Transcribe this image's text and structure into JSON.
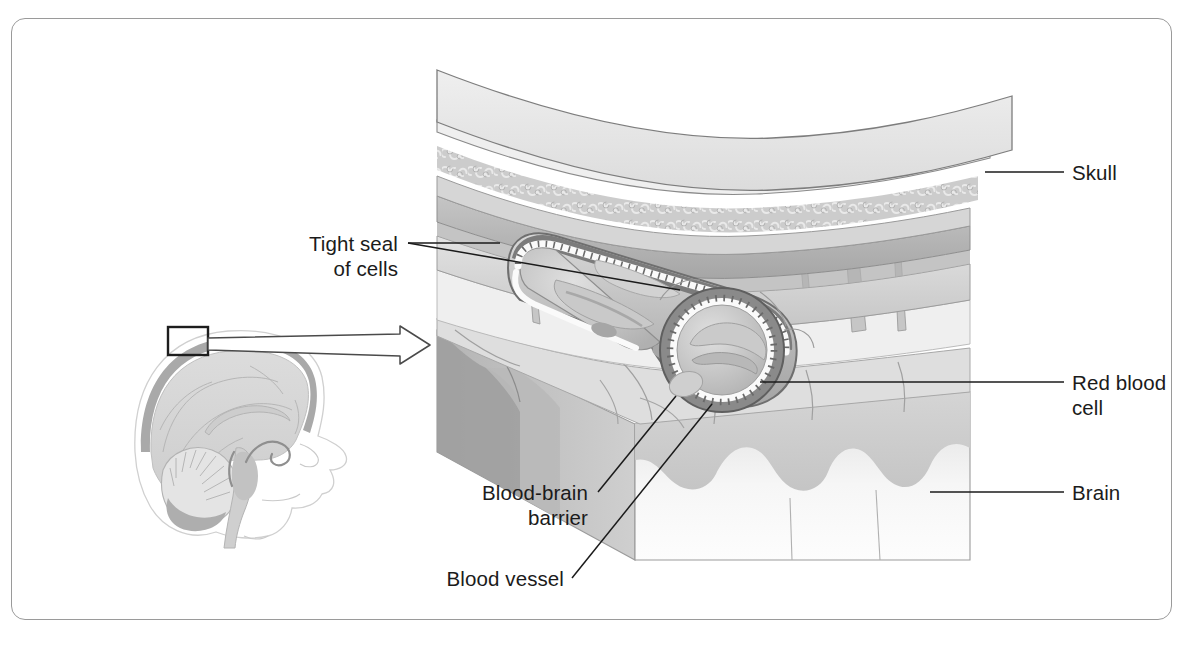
{
  "figure": {
    "frame_color": "#9a9a9a",
    "background": "#ffffff",
    "ink_color": "#1b1b1b"
  },
  "labels": {
    "skull": "Skull",
    "red_blood_cell": "Red blood\ncell",
    "brain": "Brain",
    "tight_seal": "Tight seal\nof cells",
    "blood_brain_barrier": "Blood-brain\nbarrier",
    "blood_vessel": "Blood vessel"
  },
  "inset": {
    "name": "mid-sagittal brain section",
    "callout_box": "magnified region on skull vault"
  },
  "palette": {
    "bone_outer": "#e6e6e6",
    "spongy_bone": "#c9c9c9",
    "dura": "#b8b8b8",
    "arachnoid": "#d2d2d2",
    "brain_top": "#d9d9d9",
    "brain_front": "#f2f2f2",
    "brain_side": "#c4c4c4",
    "vessel_wall": "#8e8e8e",
    "vessel_lining": "#fbfbfb",
    "rbc": "#bdbdbd",
    "outline": "#6e6e6e"
  }
}
